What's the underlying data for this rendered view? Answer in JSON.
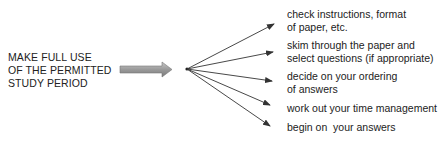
{
  "source": {
    "lines": [
      "MAKE FULL USE",
      "OF THE PERMITTED",
      "STUDY PERIOD"
    ]
  },
  "arrow_colors": {
    "block_arrow": "#9a9a9a",
    "lines": "#333333"
  },
  "items": [
    {
      "lines": [
        "check instructions, format",
        "of paper, etc."
      ]
    },
    {
      "lines": [
        "skim through the paper and",
        "select questions (if appropriate)"
      ]
    },
    {
      "lines": [
        "decide on your ordering",
        "of answers"
      ]
    },
    {
      "lines": [
        "work out your time management"
      ]
    },
    {
      "lines": [
        "begin on  your answers"
      ]
    }
  ]
}
